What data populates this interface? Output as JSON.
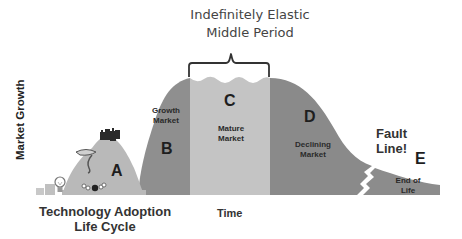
{
  "title": {
    "line1": "Indefinitely Elastic",
    "line2": "Middle Period"
  },
  "axes": {
    "y_label": "Market Growth",
    "x_label": "Time",
    "x_sub_label_line1": "Technology Adoption",
    "x_sub_label_line2": "Life Cycle"
  },
  "stages": [
    {
      "letter": "A",
      "label": ""
    },
    {
      "letter": "B",
      "label_line1": "Growth",
      "label_line2": "Market"
    },
    {
      "letter": "C",
      "label_line1": "Mature",
      "label_line2": "Market"
    },
    {
      "letter": "D",
      "label_line1": "Declining",
      "label_line2": "Market"
    },
    {
      "letter": "E",
      "label_line1": "End of",
      "label_line2": "Life"
    }
  ],
  "annotation": {
    "fault_line1": "Fault",
    "fault_line2": "Line!"
  },
  "icons": [
    "lightbulb-icon",
    "tornado-icon",
    "castle-icon",
    "bowling-icon"
  ],
  "colors": {
    "stage_a": "#b9b9b9",
    "stage_b": "#8f8f8f",
    "stage_c": "#c4c4c4",
    "stage_d": "#8a8a8a",
    "stage_e": "#8c8c8c",
    "bracket": "#333333"
  }
}
